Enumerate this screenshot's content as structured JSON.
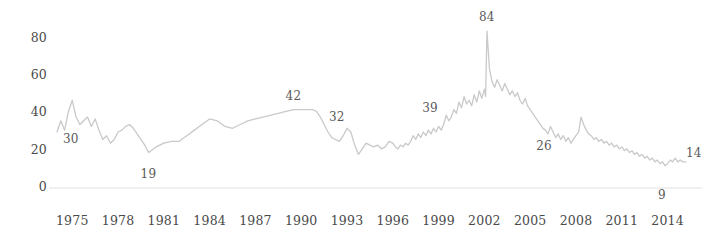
{
  "chart_data": {
    "type": "line",
    "title": "",
    "subtitle": "",
    "xlabel": "",
    "ylabel": "",
    "xlim": [
      1974.0,
      2015.6
    ],
    "ylim": [
      0,
      90
    ],
    "grid": false,
    "legend": null,
    "axis_line_color": "#e2e2e2",
    "series": [
      {
        "name": "value",
        "color": "#c9c9c9",
        "x": [
          1974.0,
          1974.25,
          1974.5,
          1974.75,
          1975.0,
          1975.25,
          1975.5,
          1975.75,
          1976.0,
          1976.25,
          1976.5,
          1976.75,
          1977.0,
          1977.25,
          1977.5,
          1977.75,
          1978.0,
          1978.25,
          1978.5,
          1978.75,
          1979.0,
          1979.25,
          1979.5,
          1979.75,
          1980.0,
          1980.5,
          1981.0,
          1981.5,
          1982.0,
          1982.5,
          1983.0,
          1983.5,
          1984.0,
          1984.5,
          1985.0,
          1985.5,
          1986.0,
          1986.5,
          1987.0,
          1987.5,
          1988.0,
          1988.5,
          1989.0,
          1989.5,
          1990.0,
          1990.25,
          1990.5,
          1990.75,
          1991.0,
          1991.25,
          1991.5,
          1991.75,
          1992.0,
          1992.25,
          1992.5,
          1992.75,
          1993.0,
          1993.25,
          1993.5,
          1993.75,
          1994.0,
          1994.25,
          1994.5,
          1994.75,
          1995.0,
          1995.25,
          1995.5,
          1995.75,
          1996.0,
          1996.17,
          1996.33,
          1996.5,
          1996.67,
          1996.83,
          1997.0,
          1997.17,
          1997.33,
          1997.5,
          1997.67,
          1997.83,
          1998.0,
          1998.17,
          1998.33,
          1998.5,
          1998.67,
          1998.83,
          1999.0,
          1999.17,
          1999.33,
          1999.5,
          1999.67,
          1999.83,
          2000.0,
          2000.17,
          2000.33,
          2000.5,
          2000.67,
          2000.83,
          2001.0,
          2001.17,
          2001.33,
          2001.5,
          2001.67,
          2001.83,
          2002.0,
          2002.08,
          2002.17,
          2002.33,
          2002.5,
          2002.67,
          2002.83,
          2003.0,
          2003.17,
          2003.33,
          2003.5,
          2003.67,
          2003.83,
          2004.0,
          2004.17,
          2004.33,
          2004.5,
          2004.67,
          2004.83,
          2005.0,
          2005.17,
          2005.33,
          2005.5,
          2005.67,
          2005.83,
          2006.0,
          2006.17,
          2006.33,
          2006.5,
          2006.67,
          2006.83,
          2007.0,
          2007.17,
          2007.33,
          2007.5,
          2007.67,
          2007.83,
          2008.0,
          2008.17,
          2008.33,
          2008.5,
          2008.67,
          2008.83,
          2009.0,
          2009.17,
          2009.33,
          2009.5,
          2009.67,
          2009.83,
          2010.0,
          2010.17,
          2010.33,
          2010.5,
          2010.67,
          2010.83,
          2011.0,
          2011.17,
          2011.33,
          2011.5,
          2011.67,
          2011.83,
          2012.0,
          2012.17,
          2012.33,
          2012.5,
          2012.67,
          2012.83,
          2013.0,
          2013.17,
          2013.33,
          2013.5,
          2013.67,
          2013.83,
          2014.0,
          2014.17,
          2014.33,
          2014.5,
          2014.67,
          2014.83,
          2015.0,
          2015.2
        ],
        "values": [
          30,
          36,
          31,
          41,
          47,
          38,
          34,
          36,
          38,
          33,
          37,
          31,
          26,
          28,
          24,
          26,
          30,
          31,
          33,
          34,
          32,
          29,
          26,
          23,
          19,
          22,
          24,
          25,
          25,
          28,
          31,
          34,
          37,
          36,
          33,
          32,
          34,
          36,
          37,
          38,
          39,
          40,
          41,
          42,
          42,
          42,
          42,
          42,
          41,
          38,
          34,
          30,
          27,
          26,
          25,
          28,
          32,
          30,
          23,
          18,
          21,
          24,
          23,
          22,
          23,
          21,
          22,
          25,
          24,
          22,
          21,
          23,
          22,
          24,
          23,
          25,
          28,
          26,
          29,
          27,
          30,
          28,
          31,
          29,
          32,
          30,
          33,
          31,
          34,
          39,
          36,
          38,
          42,
          40,
          46,
          43,
          49,
          45,
          47,
          44,
          50,
          46,
          52,
          48,
          53,
          49,
          84,
          64,
          57,
          54,
          58,
          55,
          52,
          56,
          53,
          50,
          52,
          49,
          51,
          47,
          45,
          48,
          44,
          42,
          40,
          38,
          36,
          34,
          32,
          31,
          29,
          33,
          30,
          27,
          29,
          26,
          28,
          25,
          27,
          24,
          26,
          28,
          30,
          38,
          34,
          31,
          29,
          28,
          26,
          27,
          25,
          26,
          24,
          25,
          23,
          24,
          22,
          23,
          21,
          22,
          20,
          21,
          19,
          20,
          18,
          19,
          17,
          18,
          16,
          17,
          15,
          16,
          14,
          15,
          13,
          14,
          12,
          13,
          15,
          14,
          16,
          14,
          15,
          14,
          14
        ]
      }
    ],
    "y_ticks": [
      {
        "label": "0",
        "value": 0
      },
      {
        "label": "20",
        "value": 20
      },
      {
        "label": "40",
        "value": 40
      },
      {
        "label": "60",
        "value": 60
      },
      {
        "label": "80",
        "value": 80
      }
    ],
    "x_ticks": [
      {
        "label": "1975",
        "value": 1975
      },
      {
        "label": "1978",
        "value": 1978
      },
      {
        "label": "1981",
        "value": 1981
      },
      {
        "label": "1984",
        "value": 1984
      },
      {
        "label": "1987",
        "value": 1987
      },
      {
        "label": "1990",
        "value": 1990
      },
      {
        "label": "1993",
        "value": 1993
      },
      {
        "label": "1996",
        "value": 1996
      },
      {
        "label": "1999",
        "value": 1999
      },
      {
        "label": "2002",
        "value": 2002
      },
      {
        "label": "2005",
        "value": 2005
      },
      {
        "label": "2008",
        "value": 2008
      },
      {
        "label": "2011",
        "value": 2011
      },
      {
        "label": "2014",
        "value": 2014
      }
    ],
    "annotations": [
      {
        "label": "30",
        "x": 1974.0,
        "y": 30,
        "dx": 14,
        "dy": 8
      },
      {
        "label": "19",
        "x": 1980.0,
        "y": 19,
        "dx": 0,
        "dy": 22
      },
      {
        "label": "42",
        "x": 1989.5,
        "y": 42,
        "dx": 0,
        "dy": -13
      },
      {
        "label": "32",
        "x": 1993.0,
        "y": 32,
        "dx": -10,
        "dy": -10
      },
      {
        "label": "39",
        "x": 1999.5,
        "y": 39,
        "dx": -16,
        "dy": -6
      },
      {
        "label": "84",
        "x": 2002.17,
        "y": 84,
        "dx": 0,
        "dy": -13
      },
      {
        "label": "26",
        "x": 2006.83,
        "y": 26,
        "dx": -14,
        "dy": 8
      },
      {
        "label": "14",
        "x": 2015.2,
        "y": 14,
        "dx": 8,
        "dy": -8
      },
      {
        "label": "9",
        "x": 2013.9,
        "y": 0,
        "dx": 0,
        "dy": 8
      }
    ]
  }
}
